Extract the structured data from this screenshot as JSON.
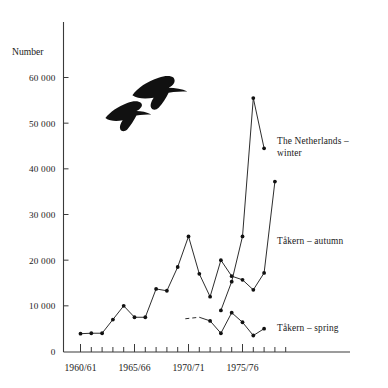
{
  "chart_data": {
    "type": "line",
    "title": "",
    "subtitle": "",
    "xlabel": "",
    "ylabel": "Number",
    "ylim": [
      0,
      65000
    ],
    "yticks": [
      0,
      10000,
      20000,
      30000,
      40000,
      50000,
      60000
    ],
    "ytick_labels": [
      "0",
      "10 000",
      "20 000",
      "30 000",
      "40 000",
      "50 000",
      "60 000"
    ],
    "xlim": [
      1960,
      1979
    ],
    "xticks": [
      1960,
      1961,
      1962,
      1963,
      1964,
      1965,
      1966,
      1967,
      1968,
      1969,
      1970,
      1971,
      1972,
      1973,
      1974,
      1975,
      1976,
      1977,
      1978,
      1979
    ],
    "xtick_labels": [
      "1960/61",
      "1965/66",
      "1970/71",
      "1975/76"
    ],
    "xtick_label_years": [
      1960,
      1965,
      1970,
      1975
    ],
    "grid": false,
    "legend_position": "inline-right",
    "series": [
      {
        "name": "Tåkern – autumn",
        "label_x": 1978.4,
        "label_y": 23000,
        "x": [
          1960,
          1961,
          1962,
          1963,
          1964,
          1965,
          1966,
          1967,
          1968,
          1969,
          1970,
          1971,
          1972,
          1973,
          1974,
          1975,
          1976,
          1977,
          1978,
          1979
        ],
        "values": [
          3900,
          4000,
          4000,
          7000,
          10000,
          7500,
          7500,
          13700,
          13300,
          18500,
          25200,
          17000,
          12000,
          20000,
          16500,
          15700,
          13500,
          17200,
          37200,
          null
        ]
      },
      {
        "name": "The Netherlands – winter",
        "label_x": 1977.4,
        "label_y": 45500,
        "x": [
          1973,
          1974,
          1975,
          1976,
          1977
        ],
        "values": [
          9000,
          15300,
          25200,
          55500,
          44500
        ]
      },
      {
        "name": "Tåkern – spring",
        "label_x": 1978.4,
        "label_y": 5200,
        "x": [
          1971,
          1972,
          1973,
          1974,
          1975,
          1976,
          1977,
          1978
        ],
        "values": [
          7500,
          6700,
          4000,
          8500,
          6400,
          3500,
          5000,
          null
        ],
        "dashed_lead_in": true
      }
    ],
    "decorations": [
      {
        "name": "goose-silhouette-lower",
        "x": 1963.6,
        "y": 52500
      },
      {
        "name": "goose-silhouette-upper",
        "x": 1966.1,
        "y": 58000
      }
    ]
  },
  "labels": {
    "y_axis_title": "Number",
    "netherlands_line1": "The  Netherlands –",
    "netherlands_line2": "winter",
    "takern_autumn": "Tåkern – autumn",
    "takern_spring": "Tåkern – spring"
  },
  "colors": {
    "ink": "#1a1a1a",
    "line": "#222222",
    "axis": "#3a3a3a",
    "background": "#ffffff"
  }
}
